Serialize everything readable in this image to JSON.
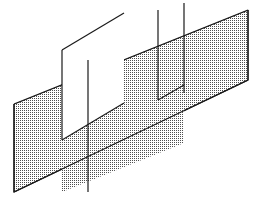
{
  "figure": {
    "title": "Three overlapping parallelogram planes in oblique projection",
    "type": "line-art-diagram",
    "canvas": {
      "width": 262,
      "height": 207,
      "background": "#ffffff"
    },
    "style": {
      "stroke_color": "#1a1a1a",
      "stroke_width": 1.2,
      "fill_pattern": "stipple-dot",
      "fill_dot_color": "#555555",
      "fill_background": "#ffffff",
      "dot_spacing_px": 2,
      "dot_radius_px": 0.45
    },
    "shapes": [
      {
        "name": "back-plane-large",
        "label": "Large rear plane",
        "filled": true,
        "points": "14,104 248,10 248,80 14,192"
      },
      {
        "name": "middle-plane",
        "label": "Middle plane",
        "filled": true,
        "points": "62,122 184,73 184,143 62,192"
      },
      {
        "name": "front-plane-outline",
        "label": "Front outlined plane",
        "filled": false,
        "points": "62,50 124,13 124,103 62,140"
      }
    ],
    "edges": [
      {
        "name": "front-plane-top-edge",
        "from": "62,50",
        "to": "124,13"
      },
      {
        "name": "front-plane-left-edge",
        "from": "62,50",
        "to": "62,140"
      },
      {
        "name": "front-plane-bottom-edge",
        "from": "62,140",
        "to": "124,103"
      },
      {
        "name": "middle-plane-left-edge",
        "from": "88,60",
        "to": "88,150"
      },
      {
        "name": "vertical-edge-inner",
        "from": "158,10",
        "to": "158,100"
      },
      {
        "name": "vertical-edge-outer",
        "from": "184,3",
        "to": "184,93"
      }
    ]
  }
}
